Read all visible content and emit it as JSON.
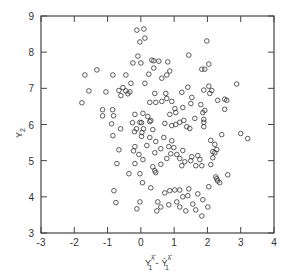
{
  "chart_data": {
    "type": "scatter",
    "title": "",
    "xlabel": "Y1^λ̂ − Ȳ1^λ̂",
    "xlabel_parts": {
      "main": "Y",
      "sub": "1",
      "sup": "λ̂",
      "minus": "-",
      "main2": "Ȳ",
      "sub2": "1",
      "sup2": "λ̂"
    },
    "ylabel": "Y2",
    "ylabel_parts": {
      "main": "Y",
      "sub": "2"
    },
    "xlim": [
      -3,
      4
    ],
    "ylim": [
      3,
      9
    ],
    "xticks": [
      -3,
      -2,
      -1,
      0,
      1,
      2,
      3,
      4
    ],
    "yticks": [
      3,
      4,
      5,
      6,
      7,
      8,
      9
    ],
    "xtick_labels": [
      "-3",
      "-2",
      "-1",
      "0",
      "1",
      "2",
      "3",
      "4"
    ],
    "ytick_labels": [
      "3",
      "4",
      "5",
      "6",
      "7",
      "8",
      "9"
    ],
    "marker": "open-circle",
    "grid": false,
    "legend": null,
    "points": [
      [
        -1.68,
        7.37
      ],
      [
        -1.32,
        7.51
      ],
      [
        -0.84,
        7.37
      ],
      [
        -1.56,
        6.93
      ],
      [
        -1.77,
        6.6
      ],
      [
        -1.05,
        6.9
      ],
      [
        -0.6,
        6.8
      ],
      [
        -0.66,
        6.94
      ],
      [
        -0.54,
        7.02
      ],
      [
        -0.45,
        6.93
      ],
      [
        -0.39,
        6.85
      ],
      [
        -0.33,
        6.9
      ],
      [
        -1.15,
        6.41
      ],
      [
        -1.15,
        6.24
      ],
      [
        -0.85,
        6.41
      ],
      [
        -0.82,
        6.24
      ],
      [
        -0.88,
        6.02
      ],
      [
        -0.61,
        5.88
      ],
      [
        -0.25,
        6.05
      ],
      [
        -0.19,
        5.8
      ],
      [
        -0.13,
        5.88
      ],
      [
        0.02,
        6.05
      ],
      [
        0.08,
        5.88
      ],
      [
        -0.84,
        5.69
      ],
      [
        -0.22,
        5.27
      ],
      [
        -0.06,
        5.17
      ],
      [
        0.02,
        5.67
      ],
      [
        -0.66,
        5.3
      ],
      [
        -0.72,
        4.92
      ],
      [
        -0.18,
        4.92
      ],
      [
        -0.03,
        4.64
      ],
      [
        0.05,
        4.39
      ],
      [
        -0.81,
        4.17
      ],
      [
        -0.75,
        3.84
      ],
      [
        -0.12,
        8.61
      ],
      [
        0.09,
        8.64
      ],
      [
        -0.03,
        8.28
      ],
      [
        -0.09,
        7.89
      ],
      [
        -0.24,
        7.7
      ],
      [
        0.0,
        7.7
      ],
      [
        0.33,
        7.78
      ],
      [
        0.39,
        7.56
      ],
      [
        0.54,
        7.75
      ],
      [
        -0.3,
        7.14
      ],
      [
        0.12,
        7.14
      ],
      [
        -0.45,
        7.37
      ],
      [
        0.12,
        8.39
      ],
      [
        1.98,
        8.31
      ],
      [
        0.39,
        7.76
      ],
      [
        0.81,
        7.73
      ],
      [
        1.44,
        7.92
      ],
      [
        1.83,
        7.53
      ],
      [
        1.92,
        7.53
      ],
      [
        2.04,
        7.67
      ],
      [
        0.87,
        7.48
      ],
      [
        0.24,
        7.39
      ],
      [
        0.63,
        7.28
      ],
      [
        0.78,
        7.37
      ],
      [
        2.04,
        7.06
      ],
      [
        1.41,
        7.03
      ],
      [
        1.89,
        6.95
      ],
      [
        2.07,
        6.86
      ],
      [
        2.88,
        7.12
      ],
      [
        2.52,
        6.7
      ],
      [
        0.42,
        6.86
      ],
      [
        0.75,
        6.86
      ],
      [
        0.78,
        6.72
      ],
      [
        1.23,
        6.89
      ],
      [
        1.53,
        6.75
      ],
      [
        2.13,
        6.94
      ],
      [
        2.31,
        6.67
      ],
      [
        0.27,
        6.61
      ],
      [
        0.45,
        6.61
      ],
      [
        0.63,
        6.64
      ],
      [
        0.93,
        6.64
      ],
      [
        1.02,
        6.44
      ],
      [
        1.26,
        6.47
      ],
      [
        1.5,
        6.58
      ],
      [
        1.8,
        6.55
      ],
      [
        1.92,
        6.39
      ],
      [
        2.58,
        6.67
      ],
      [
        2.52,
        6.42
      ],
      [
        0.06,
        6.31
      ],
      [
        0.21,
        6.22
      ],
      [
        0.3,
        6.11
      ],
      [
        0.87,
        6.28
      ],
      [
        1.05,
        6.33
      ],
      [
        1.62,
        6.17
      ],
      [
        1.89,
        6.06
      ],
      [
        -0.18,
        6.28
      ],
      [
        -0.03,
        6.06
      ],
      [
        0.27,
        6.08
      ],
      [
        0.36,
        5.86
      ],
      [
        0.72,
        6.03
      ],
      [
        0.93,
        5.97
      ],
      [
        1.05,
        6.0
      ],
      [
        1.17,
        6.06
      ],
      [
        1.29,
        6.11
      ],
      [
        1.38,
        5.94
      ],
      [
        1.47,
        5.89
      ],
      [
        1.86,
        6.33
      ],
      [
        1.89,
        6.14
      ],
      [
        1.89,
        5.94
      ],
      [
        2.43,
        5.72
      ],
      [
        3.0,
        5.75
      ],
      [
        3.21,
        5.61
      ],
      [
        0.03,
        5.78
      ],
      [
        0.27,
        5.64
      ],
      [
        0.45,
        5.53
      ],
      [
        0.69,
        5.64
      ],
      [
        0.93,
        5.55
      ],
      [
        0.99,
        5.36
      ],
      [
        2.1,
        5.56
      ],
      [
        2.22,
        5.45
      ],
      [
        2.28,
        5.31
      ],
      [
        2.16,
        5.25
      ],
      [
        2.22,
        5.22
      ],
      [
        0.18,
        5.42
      ],
      [
        0.42,
        5.22
      ],
      [
        0.6,
        5.33
      ],
      [
        0.84,
        5.39
      ],
      [
        0.9,
        5.19
      ],
      [
        1.08,
        5.17
      ],
      [
        1.26,
        5.28
      ],
      [
        1.53,
        5.11
      ],
      [
        1.71,
        5.14
      ],
      [
        -0.18,
        5.39
      ],
      [
        0.78,
        5.06
      ],
      [
        1.17,
        5.06
      ],
      [
        1.32,
        4.97
      ],
      [
        1.5,
        5.0
      ],
      [
        1.77,
        5.03
      ],
      [
        2.16,
        5.08
      ],
      [
        0.06,
        5.03
      ],
      [
        0.36,
        4.83
      ],
      [
        0.6,
        4.9
      ],
      [
        0.42,
        4.72
      ],
      [
        0.45,
        4.67
      ],
      [
        1.23,
        4.86
      ],
      [
        1.65,
        4.86
      ],
      [
        1.83,
        4.86
      ],
      [
        2.1,
        4.89
      ],
      [
        2.25,
        4.55
      ],
      [
        2.28,
        4.5
      ],
      [
        2.61,
        4.61
      ],
      [
        2.31,
        4.44
      ],
      [
        2.37,
        4.39
      ],
      [
        2.04,
        4.28
      ],
      [
        -0.36,
        4.64
      ],
      [
        0.3,
        4.25
      ],
      [
        0.72,
        4.11
      ],
      [
        0.87,
        4.17
      ],
      [
        1.02,
        4.19
      ],
      [
        1.17,
        4.19
      ],
      [
        1.44,
        4.22
      ],
      [
        1.41,
        4.03
      ],
      [
        1.71,
        4.08
      ],
      [
        1.56,
        3.8
      ],
      [
        1.86,
        3.92
      ],
      [
        1.65,
        3.64
      ],
      [
        2.01,
        3.72
      ],
      [
        1.83,
        3.47
      ],
      [
        1.17,
        3.72
      ],
      [
        -0.03,
        3.86
      ],
      [
        0.6,
        3.72
      ],
      [
        0.48,
        3.61
      ],
      [
        1.26,
        4.0
      ],
      [
        0.84,
        3.78
      ],
      [
        0.51,
        3.86
      ],
      [
        -0.12,
        3.67
      ],
      [
        1.08,
        3.86
      ],
      [
        1.35,
        3.61
      ]
    ]
  }
}
